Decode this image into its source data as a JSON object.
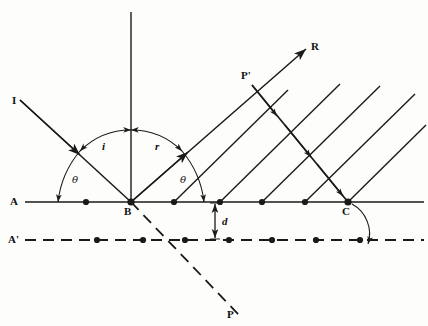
{
  "figure": {
    "type": "optics-ray-diagram",
    "background_color": "#fdfdfc",
    "stroke_color": "#1a1a1a"
  },
  "labels": {
    "incident_ray": "I",
    "reflected_ray": "R",
    "point_b": "B",
    "point_c": "C",
    "point_p": "P",
    "point_p_prime": "P'",
    "surface_line": "A",
    "image_line": "A'",
    "angle_incidence": "i",
    "angle_reflection": "r",
    "angle_theta_left": "θ",
    "angle_theta_right": "θ",
    "distance_d": "d"
  },
  "geometry": {
    "surface_y": 202,
    "image_y": 240,
    "point_b_x": 131,
    "point_c_x": 348,
    "normal_top_y": 12,
    "ray_angle_deg": 45,
    "surface_dots_x": [
      86,
      174,
      220,
      262,
      305
    ],
    "image_dots_x": [
      97,
      143,
      185,
      229,
      272,
      316,
      360
    ],
    "incident_start": [
      20,
      100
    ],
    "reflected_end": [
      306,
      49
    ],
    "p_point": [
      232,
      308
    ],
    "p_prime_point": [
      252,
      85
    ]
  },
  "annotations": {
    "d_arrow_x": 215,
    "d_label_position": [
      222,
      218
    ],
    "arc_i_radius": 72,
    "arc_theta_radius": 96
  }
}
